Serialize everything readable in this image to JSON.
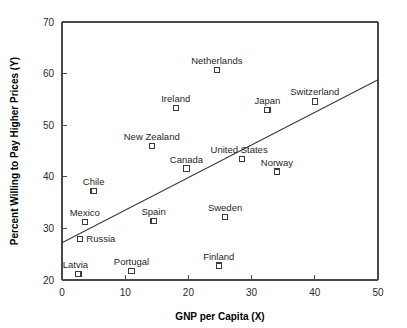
{
  "chart_data": {
    "type": "scatter",
    "title": "",
    "xlabel": "GNP per Capita (X)",
    "ylabel": "Percent Willing to Pay Higher Prices (Y)",
    "xlim": [
      0,
      50
    ],
    "ylim": [
      20,
      70
    ],
    "xticks": [
      0,
      10,
      20,
      30,
      40,
      50
    ],
    "yticks": [
      20,
      30,
      40,
      50,
      60,
      70
    ],
    "xtick_labels": [
      "0",
      "10",
      "20",
      "30",
      "40",
      "50"
    ],
    "ytick_labels": [
      "20",
      "30",
      "40",
      "50",
      "60",
      "70"
    ],
    "grid": false,
    "legend": false,
    "marker_style": "open-square",
    "points": [
      {
        "label": "Latvia",
        "x": 2.6,
        "y": 21.2,
        "label_pos": "above-left"
      },
      {
        "label": "Russia",
        "x": 2.9,
        "y": 28.0,
        "label_pos": "right"
      },
      {
        "label": "Mexico",
        "x": 3.6,
        "y": 31.3,
        "label_pos": "above"
      },
      {
        "label": "Chile",
        "x": 5.0,
        "y": 37.2,
        "label_pos": "above"
      },
      {
        "label": "Portugal",
        "x": 11.0,
        "y": 21.8,
        "label_pos": "above"
      },
      {
        "label": "New Zealand",
        "x": 14.2,
        "y": 46.0,
        "label_pos": "above"
      },
      {
        "label": "Spain",
        "x": 14.5,
        "y": 31.5,
        "label_pos": "above"
      },
      {
        "label": "Ireland",
        "x": 18.0,
        "y": 53.3,
        "label_pos": "above"
      },
      {
        "label": "Canada",
        "x": 19.7,
        "y": 41.6,
        "label_pos": "above"
      },
      {
        "label": "Netherlands",
        "x": 24.5,
        "y": 60.7,
        "label_pos": "above"
      },
      {
        "label": "Finland",
        "x": 24.8,
        "y": 22.8,
        "label_pos": "above"
      },
      {
        "label": "Sweden",
        "x": 25.8,
        "y": 32.2,
        "label_pos": "above"
      },
      {
        "label": "United States",
        "x": 28.5,
        "y": 43.5,
        "label_pos": "above-left"
      },
      {
        "label": "Japan",
        "x": 32.5,
        "y": 53.0,
        "label_pos": "above"
      },
      {
        "label": "Norway",
        "x": 34.0,
        "y": 41.0,
        "label_pos": "above"
      },
      {
        "label": "Switzerland",
        "x": 40.0,
        "y": 54.6,
        "label_pos": "above"
      }
    ],
    "trend_line": {
      "x_start": 0,
      "y_start": 27.2,
      "x_end": 50,
      "y_end": 58.8
    }
  },
  "colors": {
    "background": "#ffffff",
    "axis": "#4a4a4a",
    "marker_stroke": "#3a3a3a",
    "marker_fill": "#ffffff",
    "trend": "#3c3c3c",
    "text": "#1a1a1a"
  }
}
